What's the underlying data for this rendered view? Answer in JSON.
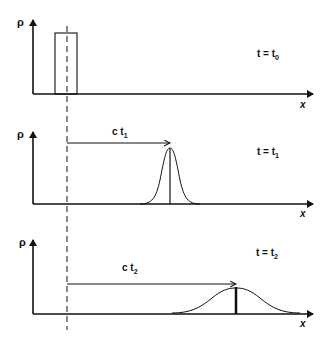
{
  "diagram": {
    "colors": {
      "line": "#111111",
      "background": "#ffffff"
    },
    "panels": [
      {
        "y_label": "ρ",
        "x_label": "x",
        "time_label": "t = t",
        "time_sub": "0",
        "shape": "rectangular pulse",
        "displacement_label": "",
        "displacement_sub": ""
      },
      {
        "y_label": "ρ",
        "x_label": "x",
        "time_label": "t = t",
        "time_sub": "1",
        "shape": "narrow gaussian",
        "displacement_label": "c t",
        "displacement_sub": "1"
      },
      {
        "y_label": "ρ",
        "x_label": "x",
        "time_label": "t = t",
        "time_sub": "2",
        "shape": "wide gaussian",
        "displacement_label": "c t",
        "displacement_sub": "2"
      }
    ]
  }
}
